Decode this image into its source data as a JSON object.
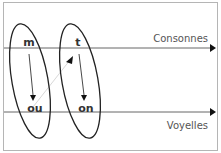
{
  "diagram": {
    "axes": [
      {
        "label": "Consonnes",
        "y": 48
      },
      {
        "label": "Voyelles",
        "y": 112
      }
    ],
    "groups": [
      {
        "top": "m",
        "bottom": "ou"
      },
      {
        "top": "t",
        "bottom": "on"
      }
    ],
    "colors": {
      "line": "#555555",
      "ellipse": "#222222",
      "text": "#333333",
      "connector": "#d8d8d8"
    }
  }
}
